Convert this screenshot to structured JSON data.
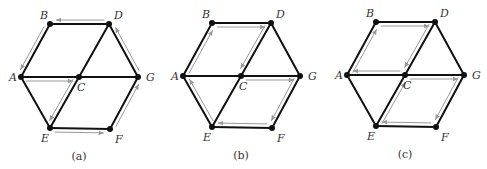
{
  "figure": {
    "panels": [
      {
        "id": "a",
        "caption": "(a)",
        "offset": [
          0,
          0
        ],
        "trail": [
          "B",
          "A",
          "C",
          "E",
          "F",
          "G",
          "D",
          "B"
        ],
        "labels": {
          "A": "A",
          "B": "B",
          "C": "C",
          "D": "D",
          "E": "E",
          "F": "F",
          "G": "G"
        }
      },
      {
        "id": "b",
        "caption": "(b)",
        "offset": [
          162,
          -1
        ],
        "trail": [
          "A",
          "B",
          "D",
          "C",
          "G",
          "F",
          "E",
          "A"
        ],
        "labels": {
          "A": "A",
          "B": "B",
          "C": "C",
          "D": "D",
          "E": "E",
          "F": "F",
          "G": "G"
        }
      },
      {
        "id": "c",
        "caption": "(c)",
        "offset": [
          326,
          -2
        ],
        "trail": [
          "A",
          "B",
          "D",
          "C",
          "G",
          "F",
          "E",
          "C",
          "A"
        ],
        "labels": {
          "A": "A",
          "B": "B",
          "C": "C",
          "D": "D",
          "E": "E",
          "F": "F",
          "G": "G"
        }
      }
    ],
    "graph": {
      "nodes": {
        "A": [
          21,
          77
        ],
        "B": [
          50,
          24
        ],
        "C": [
          79,
          77
        ],
        "D": [
          109,
          24
        ],
        "E": [
          50,
          128
        ],
        "F": [
          110,
          129
        ],
        "G": [
          138,
          77
        ]
      },
      "edges": [
        [
          "A",
          "B"
        ],
        [
          "B",
          "D"
        ],
        [
          "D",
          "G"
        ],
        [
          "G",
          "F"
        ],
        [
          "F",
          "E"
        ],
        [
          "E",
          "A"
        ],
        [
          "A",
          "C"
        ],
        [
          "C",
          "G"
        ],
        [
          "D",
          "C"
        ],
        [
          "C",
          "E"
        ]
      ]
    },
    "colors": {
      "edge": "#111111",
      "trail": "#9a9a9a",
      "node": "#111111"
    }
  }
}
